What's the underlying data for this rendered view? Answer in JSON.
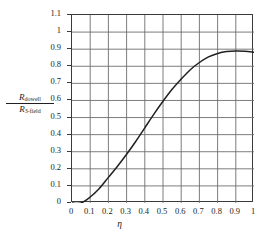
{
  "chart_data": {
    "type": "line",
    "title": "",
    "subtitle": "",
    "xlabel": "η",
    "ylabel_numerator": "R",
    "ylabel_numerator_sub": "dowell",
    "ylabel_denominator": "R",
    "ylabel_denominator_sub": "3-field",
    "ylabel_plain": "R_dowell / R_3-field",
    "xlim": [
      0,
      1
    ],
    "ylim": [
      0,
      1.1
    ],
    "xticks": [
      "0",
      "0.1",
      "0.2",
      "0.3",
      "0.4",
      "0.5",
      "0.6",
      "0.7",
      "0.8",
      "0.9",
      "1"
    ],
    "xtick_values": [
      0,
      0.1,
      0.2,
      0.3,
      0.4,
      0.5,
      0.6,
      0.7,
      0.8,
      0.9,
      1
    ],
    "yticks": [
      "0",
      "0.1",
      "0.2",
      "0.3",
      "0.4",
      "0.5",
      "0.6",
      "0.7",
      "0.8",
      "0.9",
      "1",
      "1.1"
    ],
    "ytick_values": [
      0,
      0.1,
      0.2,
      0.3,
      0.4,
      0.5,
      0.6,
      0.7,
      0.8,
      0.9,
      1.0,
      1.1
    ],
    "grid": true,
    "grid_color": "#6e6e6e",
    "axis_color": "#3b3b3b",
    "legend": null,
    "series": [
      {
        "name": "Rdowell / R3-field",
        "color": "#231f20",
        "x": [
          0.0,
          0.05,
          0.1,
          0.15,
          0.2,
          0.25,
          0.3,
          0.35,
          0.4,
          0.45,
          0.5,
          0.55,
          0.6,
          0.65,
          0.7,
          0.75,
          0.8,
          0.85,
          0.9,
          0.95,
          1.0
        ],
        "y": [
          0.0,
          0.0,
          0.035,
          0.085,
          0.15,
          0.215,
          0.285,
          0.36,
          0.44,
          0.52,
          0.595,
          0.665,
          0.725,
          0.78,
          0.822,
          0.855,
          0.875,
          0.886,
          0.89,
          0.888,
          0.882
        ]
      }
    ],
    "annotations": []
  },
  "axes": {
    "x_axis_name": "eta-axis",
    "y_axis_name": "ratio-axis"
  }
}
